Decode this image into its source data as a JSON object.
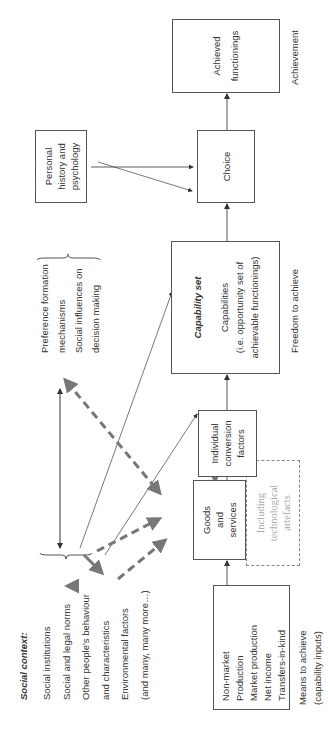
{
  "diagram": {
    "orientation": "rotated 90° counter-clockwise",
    "social_context": {
      "title": "Social context:",
      "items": [
        "Social institutions",
        "Social and legal norms",
        "Other people's behaviour",
        "and characteristics",
        "Environmental factors",
        "(and many, many more…)"
      ]
    },
    "means_box": {
      "items": [
        "Non-market",
        "Production",
        "Market production",
        "Net income",
        "Transfers-in-kind"
      ]
    },
    "means_label": {
      "line1": "Means to achieve",
      "line2": "(capability inputs)"
    },
    "goods_box": {
      "lines": [
        "Goods",
        "and",
        "services"
      ]
    },
    "tech_box": {
      "lines": [
        "Including",
        "technological",
        "artefacts"
      ]
    },
    "conversion_box": {
      "lines": [
        "Individual",
        "conversion",
        "factors"
      ]
    },
    "capability_box": {
      "title": "Capability set",
      "lines": [
        "Capabilities",
        "(i.e. opportunity set of",
        "achievable functionings)"
      ]
    },
    "freedom_label": "Freedom to achieve",
    "preference_group": {
      "items": [
        "Preference formation",
        "mechanisms",
        "Social influences on",
        "decision making"
      ]
    },
    "personal_box": {
      "lines": [
        "Personal",
        "history and",
        "psychology"
      ]
    },
    "choice_box": {
      "label": "Choice"
    },
    "achieved_box": {
      "lines": [
        "Achieved",
        "functionings"
      ]
    },
    "achievement_label": "Achievement",
    "colors": {
      "line": "#555555",
      "dashed_arrow": "#777777",
      "tech_text": "#aaaaaa"
    }
  }
}
